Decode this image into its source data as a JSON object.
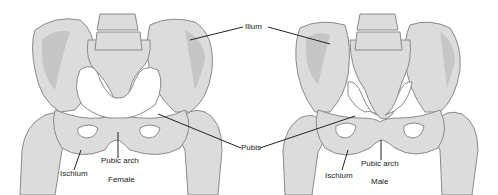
{
  "diagram": {
    "type": "anatomical-comparison",
    "panels": [
      {
        "name": "Female",
        "labels": {
          "ischium": "Ischium",
          "pubic_arch": "Pubic arch"
        }
      },
      {
        "name": "Male",
        "labels": {
          "ischium": "Ischium",
          "pubic_arch": "Pubic arch"
        }
      }
    ],
    "shared_labels": {
      "ilium": "Ilium",
      "pubis": "Pubis"
    },
    "colors": {
      "bone": "#dcdcdc",
      "bone_shade": "#c4c4c4",
      "outline": "#8a8a8a",
      "leader": "#222222"
    }
  }
}
